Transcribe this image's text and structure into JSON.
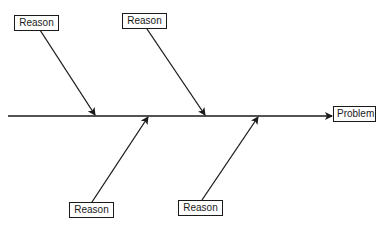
{
  "diagram": {
    "type": "fishbone",
    "effect": {
      "label": "Problem"
    },
    "causes": [
      {
        "label": "Reason",
        "position": "top-left"
      },
      {
        "label": "Reason",
        "position": "top-right"
      },
      {
        "label": "Reason",
        "position": "bottom-left"
      },
      {
        "label": "Reason",
        "position": "bottom-right"
      }
    ],
    "line_color": "#1a1a1a"
  }
}
